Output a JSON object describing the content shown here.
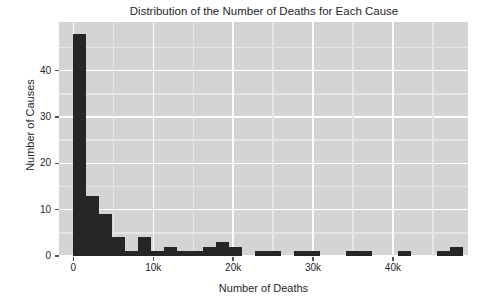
{
  "chart_data": {
    "type": "bar",
    "title": "Distribution of the Number of Deaths for Each Cause",
    "xlabel": "Number of Deaths",
    "ylabel": "Number of Causes",
    "xlim": [
      -1800,
      49400
    ],
    "ylim": [
      0,
      50.5
    ],
    "grid": true,
    "legend": null,
    "bin_width": 1625,
    "xticks": [
      {
        "value": 0,
        "label": "0"
      },
      {
        "value": 10000,
        "label": "10k"
      },
      {
        "value": 20000,
        "label": "20k"
      },
      {
        "value": 30000,
        "label": "30k"
      },
      {
        "value": 40000,
        "label": "40k"
      }
    ],
    "yticks": [
      {
        "value": 0,
        "label": "0"
      },
      {
        "value": 10,
        "label": "10"
      },
      {
        "value": 20,
        "label": "20"
      },
      {
        "value": 30,
        "label": "30"
      },
      {
        "value": 40,
        "label": "40"
      }
    ],
    "bar_color": "#262626",
    "plot_background": "#d4d4d4",
    "grid_color": "#ffffff",
    "bins": [
      {
        "x0": 0,
        "x1": 1625,
        "count": 48
      },
      {
        "x0": 1625,
        "x1": 3250,
        "count": 13
      },
      {
        "x0": 3250,
        "x1": 4875,
        "count": 9
      },
      {
        "x0": 4875,
        "x1": 6500,
        "count": 4
      },
      {
        "x0": 6500,
        "x1": 8125,
        "count": 1
      },
      {
        "x0": 8125,
        "x1": 9750,
        "count": 4
      },
      {
        "x0": 9750,
        "x1": 11375,
        "count": 1
      },
      {
        "x0": 11375,
        "x1": 13000,
        "count": 2
      },
      {
        "x0": 13000,
        "x1": 14625,
        "count": 1
      },
      {
        "x0": 14625,
        "x1": 16250,
        "count": 1
      },
      {
        "x0": 16250,
        "x1": 17875,
        "count": 2
      },
      {
        "x0": 17875,
        "x1": 19500,
        "count": 3
      },
      {
        "x0": 19500,
        "x1": 21125,
        "count": 2
      },
      {
        "x0": 21125,
        "x1": 22750,
        "count": 0
      },
      {
        "x0": 22750,
        "x1": 24375,
        "count": 1
      },
      {
        "x0": 24375,
        "x1": 26000,
        "count": 1
      },
      {
        "x0": 26000,
        "x1": 27625,
        "count": 0
      },
      {
        "x0": 27625,
        "x1": 29250,
        "count": 1
      },
      {
        "x0": 29250,
        "x1": 30875,
        "count": 1
      },
      {
        "x0": 30875,
        "x1": 32500,
        "count": 0
      },
      {
        "x0": 32500,
        "x1": 34125,
        "count": 0
      },
      {
        "x0": 34125,
        "x1": 35750,
        "count": 1
      },
      {
        "x0": 35750,
        "x1": 37375,
        "count": 1
      },
      {
        "x0": 37375,
        "x1": 39000,
        "count": 0
      },
      {
        "x0": 39000,
        "x1": 40625,
        "count": 0
      },
      {
        "x0": 40625,
        "x1": 42250,
        "count": 1
      },
      {
        "x0": 42250,
        "x1": 43875,
        "count": 0
      },
      {
        "x0": 43875,
        "x1": 45500,
        "count": 0
      },
      {
        "x0": 45500,
        "x1": 47125,
        "count": 1
      },
      {
        "x0": 47125,
        "x1": 48750,
        "count": 2
      }
    ]
  }
}
